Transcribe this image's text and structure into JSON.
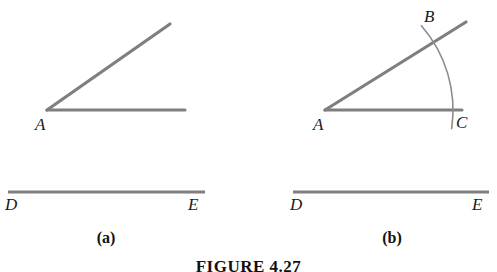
{
  "figure": {
    "caption": "FIGURE 4.27",
    "stroke_color": "#7f7f7f",
    "arc_color": "#8c8c8c",
    "label_color": "#1a1a1a",
    "panels": [
      {
        "id": "a",
        "part_label": "(a)",
        "angle": {
          "vertex_label": "A",
          "rays": [
            {
              "name": "horizontal-ray",
              "from": [
                47,
                110
              ],
              "to": [
                185,
                110
              ]
            },
            {
              "name": "upper-ray",
              "from": [
                47,
                110
              ],
              "to": [
                170,
                24
              ]
            }
          ]
        },
        "segment": {
          "start_label": "D",
          "end_label": "E",
          "from": [
            8,
            192
          ],
          "to": [
            205,
            192
          ]
        },
        "arc": null
      },
      {
        "id": "b",
        "part_label": "(b)",
        "angle": {
          "vertex_label": "A",
          "rays": [
            {
              "name": "horizontal-ray",
              "from": [
                325,
                110
              ],
              "to": [
                462,
                110
              ]
            },
            {
              "name": "upper-ray",
              "from": [
                325,
                110
              ],
              "to": [
                466,
                22
              ]
            }
          ]
        },
        "segment": {
          "start_label": "D",
          "end_label": "E",
          "from": [
            293,
            192
          ],
          "to": [
            489,
            192
          ]
        },
        "arc": {
          "center": [
            325,
            110
          ],
          "radius": 128,
          "intersection_upper_label": "B",
          "intersection_lower_label": "C",
          "intersection_upper_point": [
            430,
            40
          ],
          "intersection_lower_point": [
            452,
            112
          ]
        }
      }
    ]
  }
}
